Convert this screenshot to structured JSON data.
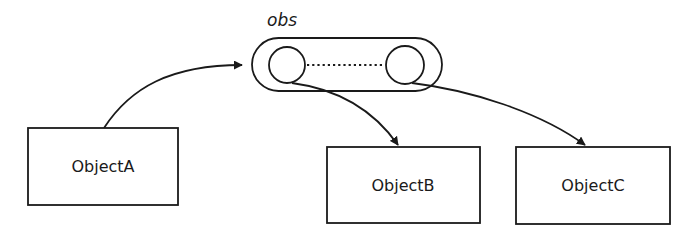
{
  "diagram": {
    "title_label": "obs",
    "nodes": [
      {
        "id": "ObjectA",
        "label": "ObjectA"
      },
      {
        "id": "ObjectB",
        "label": "ObjectB"
      },
      {
        "id": "ObjectC",
        "label": "ObjectC"
      }
    ],
    "container": {
      "label": "obs",
      "slots": 2,
      "slot_link": "dotted"
    },
    "edges": [
      {
        "from": "ObjectA",
        "to": "obs",
        "style": "curved-arrow"
      },
      {
        "from": "obs.slot1",
        "to": "ObjectB",
        "style": "curved-arrow"
      },
      {
        "from": "obs.slot2",
        "to": "ObjectC",
        "style": "curved-arrow"
      }
    ],
    "colors": {
      "stroke": "#1a1a1a",
      "background": "#ffffff"
    }
  }
}
